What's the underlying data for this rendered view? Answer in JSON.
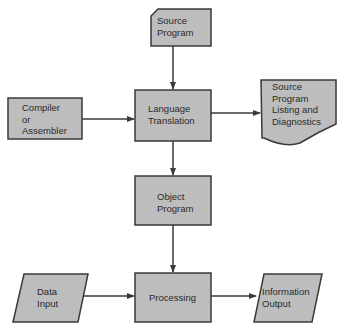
{
  "diagram": {
    "type": "flowchart",
    "colors": {
      "fill": "#bdbdbd",
      "stroke": "#3a3a3a",
      "text": "#2a2a2a",
      "background": "#ffffff"
    },
    "nodes": {
      "source_program": {
        "shape": "card",
        "lines": [
          "Source",
          "Program"
        ]
      },
      "compiler": {
        "shape": "process",
        "lines": [
          "Compiler",
          "or",
          "Assembler"
        ]
      },
      "language_translation": {
        "shape": "process",
        "lines": [
          "Language",
          "Translation"
        ]
      },
      "listing": {
        "shape": "document",
        "lines": [
          "Source",
          "Program",
          "Listing and",
          "Diagnostics"
        ]
      },
      "object_program": {
        "shape": "process",
        "lines": [
          "Object",
          "Program"
        ]
      },
      "data_input": {
        "shape": "io",
        "lines": [
          "Data",
          "Input"
        ]
      },
      "processing": {
        "shape": "process",
        "lines": [
          "Processing"
        ]
      },
      "information_output": {
        "shape": "io",
        "lines": [
          "Information",
          "Output"
        ]
      }
    },
    "edges": [
      {
        "from": "Source Program",
        "to": "Language Translation"
      },
      {
        "from": "Compiler or Assembler",
        "to": "Language Translation"
      },
      {
        "from": "Language Translation",
        "to": "Source Program Listing and Diagnostics"
      },
      {
        "from": "Language Translation",
        "to": "Object Program"
      },
      {
        "from": "Object Program",
        "to": "Processing"
      },
      {
        "from": "Data Input",
        "to": "Processing"
      },
      {
        "from": "Processing",
        "to": "Information Output"
      }
    ]
  }
}
